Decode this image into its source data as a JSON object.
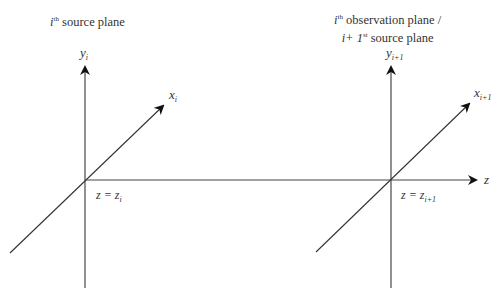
{
  "diagram": {
    "left_plane": {
      "title_prefix": "i",
      "title_sup": "th",
      "title_suffix": " source plane",
      "y_axis_var": "y",
      "y_axis_sub": "i",
      "x_axis_var": "x",
      "x_axis_sub": "i",
      "z_position_label": "z = z",
      "z_position_sub": "i"
    },
    "right_plane": {
      "title_line1_prefix": "i",
      "title_line1_sup": "th",
      "title_line1_suffix": " observation plane /",
      "title_line2_prefix": "i+ 1",
      "title_line2_sup": "st",
      "title_line2_suffix": " source plane",
      "y_axis_var": "y",
      "y_axis_sub": "i+1",
      "x_axis_var": "x",
      "x_axis_sub": "i+1",
      "z_position_label": "z = z",
      "z_position_sub": "i+1"
    },
    "z_axis_label": "z",
    "line_color": "#222222",
    "axis_color": "#444444"
  }
}
